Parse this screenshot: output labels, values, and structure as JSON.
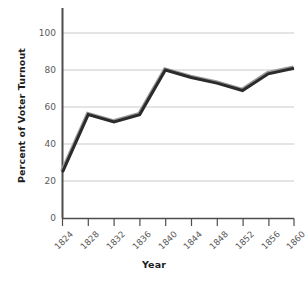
{
  "chart_data": {
    "type": "line",
    "title": "",
    "subtitle": "",
    "xlabel": "Year",
    "ylabel": "Percent of Voter Turnout",
    "categories": [
      "1824",
      "1828",
      "1832",
      "1836",
      "1840",
      "1844",
      "1848",
      "1852",
      "1856",
      "1860"
    ],
    "x": [
      1824,
      1828,
      1832,
      1836,
      1840,
      1844,
      1848,
      1852,
      1856,
      1860
    ],
    "values": [
      25,
      56,
      52,
      56,
      80,
      76,
      73,
      69,
      78,
      81
    ],
    "series": [
      {
        "name": "Percent of Voter Turnout",
        "values": [
          25,
          56,
          52,
          56,
          80,
          76,
          73,
          69,
          78,
          81
        ]
      }
    ],
    "xlim": [
      1824,
      1860
    ],
    "ylim": [
      0,
      100
    ],
    "ytick_values": [
      0,
      20,
      40,
      60,
      80,
      100
    ],
    "ytick_labels": [
      "0",
      "20",
      "40",
      "60",
      "80",
      "100"
    ],
    "xtick_labels": [
      "1824",
      "1828",
      "1832",
      "1836",
      "1840",
      "1844",
      "1848",
      "1852",
      "1856",
      "1860"
    ],
    "grid": true,
    "grid_axis": "y",
    "legend": false,
    "legend_position": "none",
    "annotations": [],
    "line_color": "#2b2b2b",
    "line_shadow_color": "#9b9b9b",
    "grid_color": "#c9c9c9",
    "axis_color": "#4d4d4d",
    "tick_label_color": "#5a5a5a",
    "title_color": "#1c1c1c",
    "background_color": "#ffffff",
    "line_width": 3
  }
}
